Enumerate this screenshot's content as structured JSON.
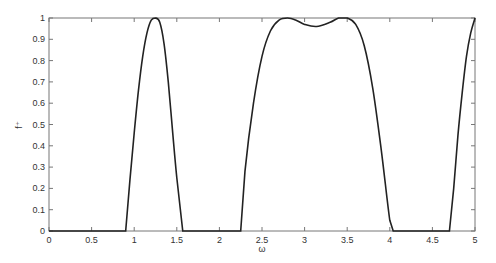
{
  "chart_data": {
    "type": "line",
    "title": "",
    "xlabel": "ω",
    "ylabel": "f⁺",
    "xlim": [
      0,
      5
    ],
    "ylim": [
      0,
      1
    ],
    "grid": false,
    "legend": null,
    "x_ticks": [
      "0",
      "0.5",
      "1",
      "1.5",
      "2",
      "2.5",
      "3",
      "3.5",
      "4",
      "4.5",
      "5"
    ],
    "y_ticks": [
      "0",
      "0.1",
      "0.2",
      "0.3",
      "0.4",
      "0.5",
      "0.6",
      "0.7",
      "0.8",
      "0.9",
      "1"
    ],
    "series": [
      {
        "name": "f+",
        "color": "#222222",
        "x": [
          0,
          0.5,
          0.9,
          0.95,
          1.0,
          1.05,
          1.1,
          1.15,
          1.2,
          1.25,
          1.3,
          1.35,
          1.4,
          1.45,
          1.5,
          1.57,
          1.6,
          2.0,
          2.25,
          2.3,
          2.4,
          2.5,
          2.6,
          2.7,
          2.8,
          2.9,
          3.0,
          3.14,
          3.3,
          3.4,
          3.5,
          3.6,
          3.7,
          3.8,
          3.9,
          4.0,
          4.04,
          4.2,
          4.5,
          4.7,
          4.75,
          4.8,
          4.85,
          4.9,
          4.95,
          5.0
        ],
        "y": [
          0,
          0,
          0,
          0.24,
          0.46,
          0.66,
          0.82,
          0.93,
          0.99,
          1.0,
          0.98,
          0.88,
          0.7,
          0.47,
          0.25,
          0,
          0,
          0,
          0,
          0.28,
          0.6,
          0.82,
          0.94,
          0.99,
          1.0,
          0.99,
          0.97,
          0.96,
          0.98,
          1.0,
          1.0,
          0.97,
          0.87,
          0.67,
          0.38,
          0.05,
          0,
          0,
          0,
          0,
          0.2,
          0.45,
          0.65,
          0.82,
          0.93,
          1.0
        ]
      }
    ]
  }
}
